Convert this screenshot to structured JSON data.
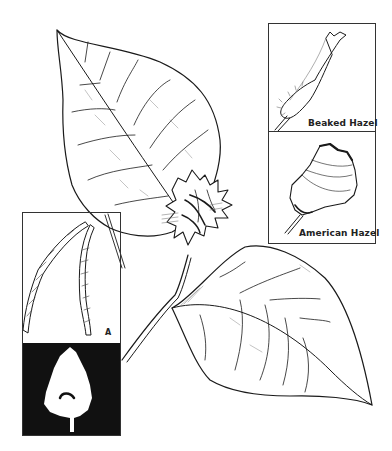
{
  "illustration": {
    "subject": "hazel branch with leaves and nut husk",
    "colors": {
      "ink": "#1a1a1a",
      "paper": "#ffffff",
      "silhouette_bg": "#111111"
    }
  },
  "insets": {
    "beaked": {
      "label": "Beaked Hazel"
    },
    "american": {
      "label": "American Hazel"
    },
    "catkin": {
      "label": "A"
    },
    "silhouette": {
      "icon": "tree-silhouette-icon"
    }
  }
}
